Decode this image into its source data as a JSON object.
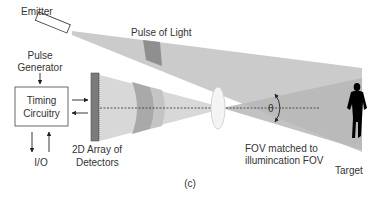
{
  "labels": {
    "emitter": "Emitter",
    "pulse_of_light": "Pulse of Light",
    "pulse_generator_line1": "Pulse",
    "pulse_generator_line2": "Generator",
    "timing_line1": "Timing",
    "timing_line2": "Circuitry",
    "io": "I/O",
    "detector_line1": "2D Array of",
    "detector_line2": "Detectors",
    "fov_line1": "FOV matched to",
    "fov_line2": "illumincation FOV",
    "theta": "θ",
    "target": "Target",
    "caption": "(c)"
  },
  "colors": {
    "beam": "#c8c8c8",
    "beam_pulse": "#8f8f8f",
    "receive_cone": "#d4d4d4",
    "receive_pulse": "#a8a8a8",
    "fov_cone": "#b4b4b4",
    "detector": "#7a7a7a",
    "silhouette": "#000000",
    "text": "#333333"
  }
}
